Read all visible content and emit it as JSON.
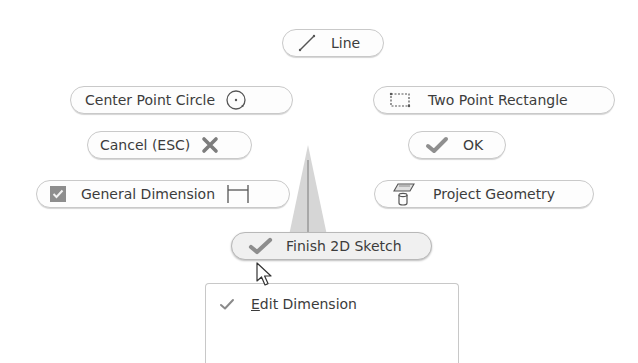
{
  "marking_menu": {
    "north": {
      "label": "Line",
      "icon": "line-icon"
    },
    "northwest": {
      "label": "Center Point Circle",
      "icon": "circle-icon"
    },
    "northeast": {
      "label": "Two Point Rectangle",
      "icon": "rectangle-icon"
    },
    "west": {
      "label": "Cancel (ESC)",
      "icon": "close-icon"
    },
    "east": {
      "label": "OK",
      "icon": "checkmark-icon"
    },
    "southwest": {
      "label": "General Dimension",
      "icon": "dimension-icon",
      "checkbox_icon": "checked-box-icon"
    },
    "southeast": {
      "label": "Project Geometry",
      "icon": "project-geometry-icon"
    },
    "south": {
      "label": "Finish 2D Sketch",
      "icon": "checkmark-icon",
      "hovered": true
    }
  },
  "overflow_menu": {
    "items": [
      {
        "label_first": "E",
        "label_rest": "dit Dimension",
        "icon": "checkmark-icon"
      }
    ]
  },
  "colors": {
    "pill_border": "#c9c9c9",
    "icon_gray": "#8a8a8a",
    "text": "#3c3c3c"
  }
}
